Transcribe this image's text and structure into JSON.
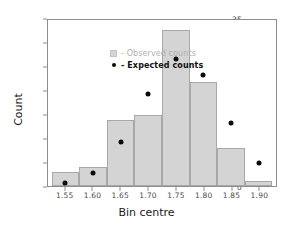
{
  "chart_data": {
    "type": "bar",
    "title": "",
    "xlabel": "Bin centre",
    "ylabel": "Count",
    "categories": [
      "1.55",
      "1.60",
      "1.65",
      "1.70",
      "1.75",
      "1.80",
      "1.85",
      "1.90"
    ],
    "bin_centres": [
      1.55,
      1.6,
      1.65,
      1.7,
      1.75,
      1.8,
      1.85,
      1.9
    ],
    "bin_width": 0.05,
    "series": [
      {
        "name": "Observed counts",
        "render": "bar",
        "color": "#d4d4d4",
        "values": [
          3,
          4,
          14,
          15,
          33,
          22,
          8,
          1
        ]
      },
      {
        "name": "Expected counts",
        "render": "point",
        "color": "#0a0a0a",
        "values": [
          0.6,
          2.7,
          9.3,
          19.5,
          26.7,
          23.4,
          13.2,
          4.8
        ]
      }
    ],
    "xlim": [
      1.5183,
      1.9317
    ],
    "ylim": [
      0,
      35
    ],
    "xticks": [
      1.55,
      1.6,
      1.65,
      1.7,
      1.75,
      1.8,
      1.85,
      1.9
    ],
    "xtick_labels": [
      "1.55",
      "1.60",
      "1.65",
      "1.70",
      "1.75",
      "1.80",
      "1.85",
      "1.90"
    ],
    "yticks": [
      0,
      5,
      10,
      15,
      20,
      25,
      30,
      35
    ],
    "ytick_labels": [
      "0",
      "5",
      "10",
      "15",
      "20",
      "25",
      "30",
      "35"
    ],
    "grid": false,
    "legend_position": "upper left"
  },
  "legend": {
    "entries": [
      {
        "marker": "square-swatch-icon",
        "label": "- Observed counts",
        "style": "muted"
      },
      {
        "marker": "dot-marker-icon",
        "label": "- Expected counts",
        "style": "bold"
      }
    ]
  }
}
